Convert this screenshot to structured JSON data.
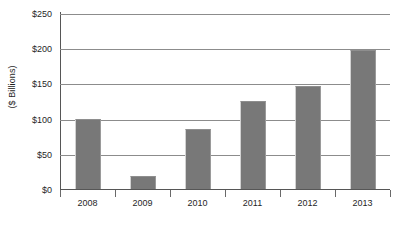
{
  "chart_data": {
    "type": "bar",
    "title": "",
    "subtitle": "",
    "xlabel": "",
    "ylabel": "($ Billions)",
    "categories": [
      "2008",
      "2009",
      "2010",
      "2011",
      "2012",
      "2013"
    ],
    "values": [
      100,
      18,
      85,
      125,
      146,
      197
    ],
    "series": [
      {
        "name": "",
        "values": [
          100,
          18,
          85,
          125,
          146,
          197
        ]
      }
    ],
    "ylim": [
      0,
      250
    ],
    "ytick_values": [
      0,
      50,
      100,
      150,
      200,
      250
    ],
    "ytick_labels": [
      "$0",
      "$50",
      "$100",
      "$150",
      "$200",
      "$250"
    ],
    "grid": "horizontal",
    "legend": "none",
    "bar_color": "#787878",
    "gridline_color": "#8c8c8c",
    "axis_color": "#565656",
    "background_color": "#ffffff"
  },
  "axis": {
    "y_title": "($ Billions)"
  },
  "caption": {
    "cut_off_text": ""
  }
}
